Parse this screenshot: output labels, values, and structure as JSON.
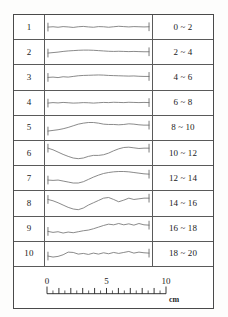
{
  "figure": {
    "caption_unit": "cm",
    "axis_label_unit": "cm"
  },
  "colors": {
    "frame": "#4a4a4a",
    "divider": "#5a5a5a",
    "trace": "#7a7a7a",
    "cap": "#6a6a6a",
    "text": "#1b1b1b",
    "background": "#ffffff"
  },
  "table": {
    "rows": [
      {
        "index": "1",
        "label": "0 ~ 2"
      },
      {
        "index": "2",
        "label": "2 ~ 4"
      },
      {
        "index": "3",
        "label": "4 ~ 6"
      },
      {
        "index": "4",
        "label": "6 ~ 8"
      },
      {
        "index": "5",
        "label": "8 ~ 10"
      },
      {
        "index": "6",
        "label": "10 ~ 12"
      },
      {
        "index": "7",
        "label": "12 ~ 14"
      },
      {
        "index": "8",
        "label": "14 ~ 16"
      },
      {
        "index": "9",
        "label": "16 ~ 18"
      },
      {
        "index": "10",
        "label": "18 ~ 20"
      }
    ]
  },
  "scale_bar": {
    "unit": "cm",
    "tick_labels": [
      "0",
      "5",
      "10"
    ],
    "tick_label_values": [
      0,
      5,
      10
    ],
    "min": 0,
    "max": 10,
    "major_interval": 1,
    "minor_per_major": 2
  },
  "chart_data": {
    "type": "line",
    "title": "",
    "subtitle": "",
    "xlabel": "cm",
    "ylabel": "",
    "xlim": [
      0,
      10
    ],
    "grid": false,
    "legend": "none",
    "note": "Ten surface-profile traces, one per table row; x in cm (0-10), y in arbitrary relative profile-height units centered at 0.",
    "x": [
      0,
      0.5,
      1,
      1.5,
      2,
      2.5,
      3,
      3.5,
      4,
      4.5,
      5,
      5.5,
      6,
      6.5,
      7,
      7.5,
      8,
      8.5,
      9,
      9.5,
      10
    ],
    "series": [
      {
        "name": "1",
        "range_label": "0 ~ 2",
        "values": [
          0,
          0.02,
          -0.01,
          0.03,
          0.01,
          -0.02,
          0.02,
          0.04,
          0.01,
          -0.01,
          0.03,
          0.02,
          -0.01,
          0.02,
          0.05,
          0.03,
          0.01,
          0.03,
          0.02,
          0.01,
          0.02
        ]
      },
      {
        "name": "2",
        "range_label": "2 ~ 4",
        "values": [
          -0.06,
          -0.03,
          0.0,
          0.04,
          0.07,
          0.09,
          0.11,
          0.12,
          0.12,
          0.11,
          0.09,
          0.07,
          0.05,
          0.04,
          0.05,
          0.04,
          0.03,
          0.04,
          0.03,
          0.02,
          0.02
        ]
      },
      {
        "name": "3",
        "range_label": "4 ~ 6",
        "values": [
          -0.02,
          0.0,
          -0.03,
          0.02,
          0.0,
          0.04,
          0.08,
          0.1,
          0.11,
          0.12,
          0.13,
          0.12,
          0.1,
          0.09,
          0.08,
          0.07,
          0.06,
          0.07,
          0.05,
          0.04,
          0.04
        ]
      },
      {
        "name": "4",
        "range_label": "6 ~ 8",
        "values": [
          0.0,
          0.03,
          0.01,
          0.04,
          0.02,
          0.0,
          0.01,
          0.03,
          0.02,
          0.0,
          0.02,
          0.04,
          0.03,
          0.05,
          0.04,
          0.03,
          0.05,
          0.04,
          0.03,
          0.04,
          0.03
        ]
      },
      {
        "name": "5",
        "range_label": "8 ~ 10",
        "values": [
          -0.18,
          -0.14,
          -0.1,
          -0.04,
          0.04,
          0.14,
          0.24,
          0.3,
          0.34,
          0.34,
          0.3,
          0.24,
          0.22,
          0.22,
          0.2,
          0.22,
          0.26,
          0.24,
          0.2,
          0.18,
          0.18
        ]
      },
      {
        "name": "6",
        "range_label": "10 ~ 12",
        "values": [
          0.3,
          0.2,
          0.06,
          -0.08,
          -0.2,
          -0.3,
          -0.34,
          -0.3,
          -0.2,
          -0.14,
          -0.14,
          -0.1,
          0.0,
          0.14,
          0.26,
          0.34,
          0.36,
          0.32,
          0.28,
          0.3,
          0.3
        ]
      },
      {
        "name": "7",
        "range_label": "12 ~ 14",
        "values": [
          -0.12,
          -0.14,
          -0.12,
          -0.18,
          -0.24,
          -0.3,
          -0.3,
          -0.22,
          -0.08,
          0.06,
          0.18,
          0.28,
          0.34,
          0.38,
          0.4,
          0.4,
          0.38,
          0.34,
          0.3,
          0.26,
          0.24
        ]
      },
      {
        "name": "8",
        "range_label": "14 ~ 16",
        "values": [
          0.22,
          0.14,
          0.02,
          -0.12,
          -0.26,
          -0.36,
          -0.4,
          -0.3,
          -0.12,
          0.02,
          0.16,
          0.3,
          0.34,
          0.22,
          0.08,
          0.18,
          0.3,
          0.22,
          0.26,
          0.3,
          0.3
        ]
      },
      {
        "name": "9",
        "range_label": "16 ~ 18",
        "values": [
          -0.14,
          -0.2,
          -0.16,
          -0.24,
          -0.18,
          -0.22,
          -0.16,
          -0.1,
          -0.06,
          0.02,
          0.12,
          0.22,
          0.3,
          0.26,
          0.34,
          0.26,
          0.32,
          0.24,
          0.34,
          0.26,
          0.24
        ]
      },
      {
        "name": "10",
        "range_label": "18 ~ 20",
        "values": [
          -0.12,
          -0.18,
          -0.14,
          -0.04,
          0.12,
          0.1,
          0.0,
          0.04,
          -0.02,
          0.06,
          0.0,
          0.08,
          0.02,
          0.1,
          0.04,
          0.1,
          0.16,
          0.06,
          0.12,
          0.08,
          0.06
        ]
      }
    ]
  }
}
